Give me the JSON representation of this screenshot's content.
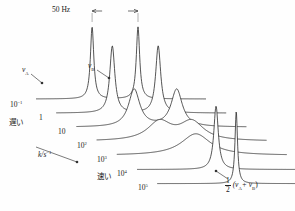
{
  "figure": {
    "type": "nmr-exchange-waterfall",
    "scale_label": "50 Hz",
    "rate_axis_label": "k/s",
    "rate_axis_exponent": "−1",
    "peak_a_label": "ν",
    "peak_a_sub": "A",
    "peak_b_label": "ν",
    "peak_b_sub": "B",
    "slow_label": "遅い",
    "fast_label": "速い",
    "coalesced_numerator": "1",
    "coalesced_denominator": "2",
    "coalesced_expr": "(ν",
    "coalesced_sub_a": "A",
    "coalesced_plus": "+ ν",
    "coalesced_sub_b": "B",
    "coalesced_close": ")",
    "rate_ticks": [
      {
        "mantissa": "10",
        "exponent": "−1"
      },
      {
        "mantissa": "1",
        "exponent": ""
      },
      {
        "mantissa": "10",
        "exponent": ""
      },
      {
        "mantissa": "10",
        "exponent": "2"
      },
      {
        "mantissa": "10",
        "exponent": "3"
      },
      {
        "mantissa": "10",
        "exponent": "4"
      },
      {
        "mantissa": "10",
        "exponent": "5"
      }
    ],
    "colors": {
      "trace": "#2a2a2a",
      "label": "#1a1a1a",
      "arrow": "#333333"
    }
  },
  "chart_data": {
    "type": "line",
    "title": "",
    "xlabel": "chemical shift (ν)",
    "ylabel": "intensity",
    "zlabel": "k/s⁻¹",
    "grid": false,
    "legend": "none",
    "xlim": [
      0,
      1
    ],
    "annotations": [
      "50 Hz",
      "νA",
      "νB",
      "遅い (slow)",
      "速い (fast)",
      "k/s⁻¹",
      "½(νA + νB)"
    ],
    "series": [
      {
        "name": "k = 10⁻¹ s⁻¹",
        "k": 0.1,
        "peaks": [
          {
            "center": 0.33,
            "height": 1.0,
            "width": 0.012
          },
          {
            "center": 0.6,
            "height": 1.0,
            "width": 0.012
          }
        ]
      },
      {
        "name": "k = 1 s⁻¹",
        "k": 1,
        "peaks": [
          {
            "center": 0.33,
            "height": 0.93,
            "width": 0.018
          },
          {
            "center": 0.6,
            "height": 0.93,
            "width": 0.018
          }
        ]
      },
      {
        "name": "k = 10 s⁻¹",
        "k": 10,
        "peaks": [
          {
            "center": 0.34,
            "height": 0.52,
            "width": 0.04
          },
          {
            "center": 0.59,
            "height": 0.52,
            "width": 0.04
          }
        ]
      },
      {
        "name": "k = 10² s⁻¹",
        "k": 100,
        "peaks": [
          {
            "center": 0.37,
            "height": 0.26,
            "width": 0.085
          },
          {
            "center": 0.56,
            "height": 0.26,
            "width": 0.085
          }
        ]
      },
      {
        "name": "k = 10³ s⁻¹ (coalescence)",
        "k": 1000,
        "peaks": [
          {
            "center": 0.465,
            "height": 0.3,
            "width": 0.105
          }
        ]
      },
      {
        "name": "k = 10⁴ s⁻¹",
        "k": 10000,
        "peaks": [
          {
            "center": 0.465,
            "height": 0.88,
            "width": 0.016
          }
        ]
      },
      {
        "name": "k = 10⁵ s⁻¹",
        "k": 100000,
        "peaks": [
          {
            "center": 0.465,
            "height": 1.0,
            "width": 0.009
          }
        ]
      }
    ]
  }
}
